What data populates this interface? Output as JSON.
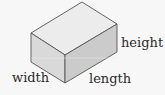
{
  "diagram": {
    "shape": "rectangular-prism",
    "labels": {
      "height": "height",
      "width": "width",
      "length": "length"
    },
    "colors": {
      "background": "#f7f7f7",
      "top_face": "#ececec",
      "left_face": "#d9d9d9",
      "right_face": "#cbcbcb",
      "edge": "#555555",
      "text": "#2a2a2a"
    }
  }
}
